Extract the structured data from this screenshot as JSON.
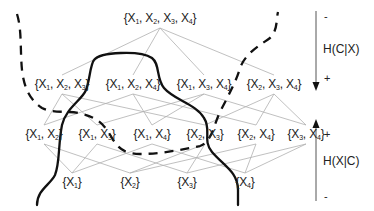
{
  "diagram": {
    "type": "subset-lattice",
    "levels": [
      {
        "size": 4,
        "nodes": [
          {
            "id": "1234",
            "label": "{X1, X2, X3, X4}",
            "x": 160,
            "y": 18
          }
        ]
      },
      {
        "size": 3,
        "nodes": [
          {
            "id": "123",
            "label": "{X1, X2, X3}",
            "x": 62,
            "y": 84
          },
          {
            "id": "124",
            "label": "{X1, X2, X4}",
            "x": 133,
            "y": 84
          },
          {
            "id": "134",
            "label": "{X1, X3, X4}",
            "x": 204,
            "y": 84
          },
          {
            "id": "234",
            "label": "{X2, X3, X4}",
            "x": 274,
            "y": 84
          }
        ]
      },
      {
        "size": 2,
        "nodes": [
          {
            "id": "12",
            "label": "{X1, X2}",
            "x": 44,
            "y": 134
          },
          {
            "id": "13",
            "label": "{X1, X3}",
            "x": 97,
            "y": 134
          },
          {
            "id": "14",
            "label": "{X1, X4}",
            "x": 152,
            "y": 134
          },
          {
            "id": "23",
            "label": "{X2, X3}",
            "x": 205,
            "y": 134
          },
          {
            "id": "24",
            "label": "{X2, X4}",
            "x": 256,
            "y": 134
          },
          {
            "id": "34",
            "label": "{X3, X4}",
            "x": 306,
            "y": 134
          }
        ]
      },
      {
        "size": 1,
        "nodes": [
          {
            "id": "1",
            "label": "{X1}",
            "x": 72,
            "y": 182
          },
          {
            "id": "2",
            "label": "{X2}",
            "x": 130,
            "y": 182
          },
          {
            "id": "3",
            "label": "{X3}",
            "x": 187,
            "y": 182
          },
          {
            "id": "4",
            "label": "{X4}",
            "x": 245,
            "y": 182
          }
        ]
      }
    ],
    "edge_color": "#b0b0b0",
    "curve_color": "#111111",
    "curves": [
      {
        "name": "solid-boundary",
        "style": "solid"
      },
      {
        "name": "dashed-boundary",
        "style": "dashed"
      }
    ],
    "axes": {
      "top": {
        "label": "H(C|X)",
        "top_sign": "-",
        "bottom_sign": "+",
        "direction": "down"
      },
      "bottom": {
        "label": "H(X|C)",
        "top_sign": "+",
        "bottom_sign": "-",
        "direction": "up"
      }
    }
  }
}
